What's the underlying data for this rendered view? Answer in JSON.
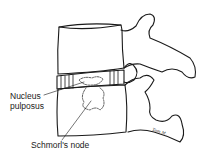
{
  "diagram": {
    "labels": {
      "nucleus_line1": "Nucleus",
      "nucleus_line2": "pulposus",
      "schmorl": "Schmorl's node"
    },
    "signature": "Tom M.",
    "colors": {
      "line": "#1a1a1a",
      "background": "#ffffff"
    }
  }
}
